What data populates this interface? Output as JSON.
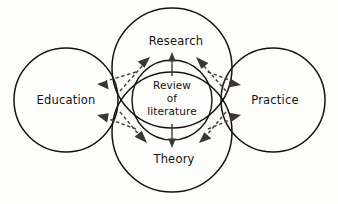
{
  "diagram": {
    "background_color": "#fdfdfb",
    "stroke_color": "#15120f",
    "arrow_color": "#3b3633",
    "nodes": {
      "education": {
        "label": "Education",
        "cx": 66,
        "cy": 100,
        "r": 52
      },
      "research": {
        "label": "Research",
        "cx": 172,
        "cy": 68,
        "r": 60
      },
      "theory": {
        "label": "Theory",
        "cx": 172,
        "cy": 132,
        "r": 60
      },
      "practice": {
        "label": "Practice",
        "cx": 273,
        "cy": 100,
        "r": 52
      },
      "core": {
        "label_line1": "Review",
        "label_line2": "of",
        "label_line3": "literature",
        "cx": 172,
        "cy": 100,
        "r": 40
      }
    },
    "label_positions": {
      "education": {
        "x": 66,
        "y": 104
      },
      "research": {
        "x": 176,
        "y": 45
      },
      "theory": {
        "x": 174,
        "y": 163
      },
      "practice": {
        "x": 275,
        "y": 104
      },
      "core_line1_y": 89,
      "core_line2_y": 102,
      "core_line3_y": 115
    },
    "arrows": [
      {
        "name": "core-to-research",
        "style": "solid",
        "from": "core",
        "to": "research"
      },
      {
        "name": "core-to-theory",
        "style": "solid",
        "from": "core",
        "to": "theory"
      },
      {
        "name": "core-to-research-upper-left",
        "style": "dashed",
        "from": "core",
        "to": "research"
      },
      {
        "name": "core-to-research-upper-right",
        "style": "dashed",
        "from": "core",
        "to": "research"
      },
      {
        "name": "core-to-theory-lower-left",
        "style": "dashed",
        "from": "core",
        "to": "theory"
      },
      {
        "name": "core-to-theory-lower-right",
        "style": "dashed",
        "from": "core",
        "to": "theory"
      },
      {
        "name": "core-to-education-upper",
        "style": "dashed",
        "from": "core",
        "to": "education"
      },
      {
        "name": "core-to-education-lower",
        "style": "dashed",
        "from": "core",
        "to": "education"
      },
      {
        "name": "core-to-practice-upper",
        "style": "dashed",
        "from": "core",
        "to": "practice"
      },
      {
        "name": "core-to-practice-lower",
        "style": "dashed",
        "from": "core",
        "to": "practice"
      }
    ]
  }
}
